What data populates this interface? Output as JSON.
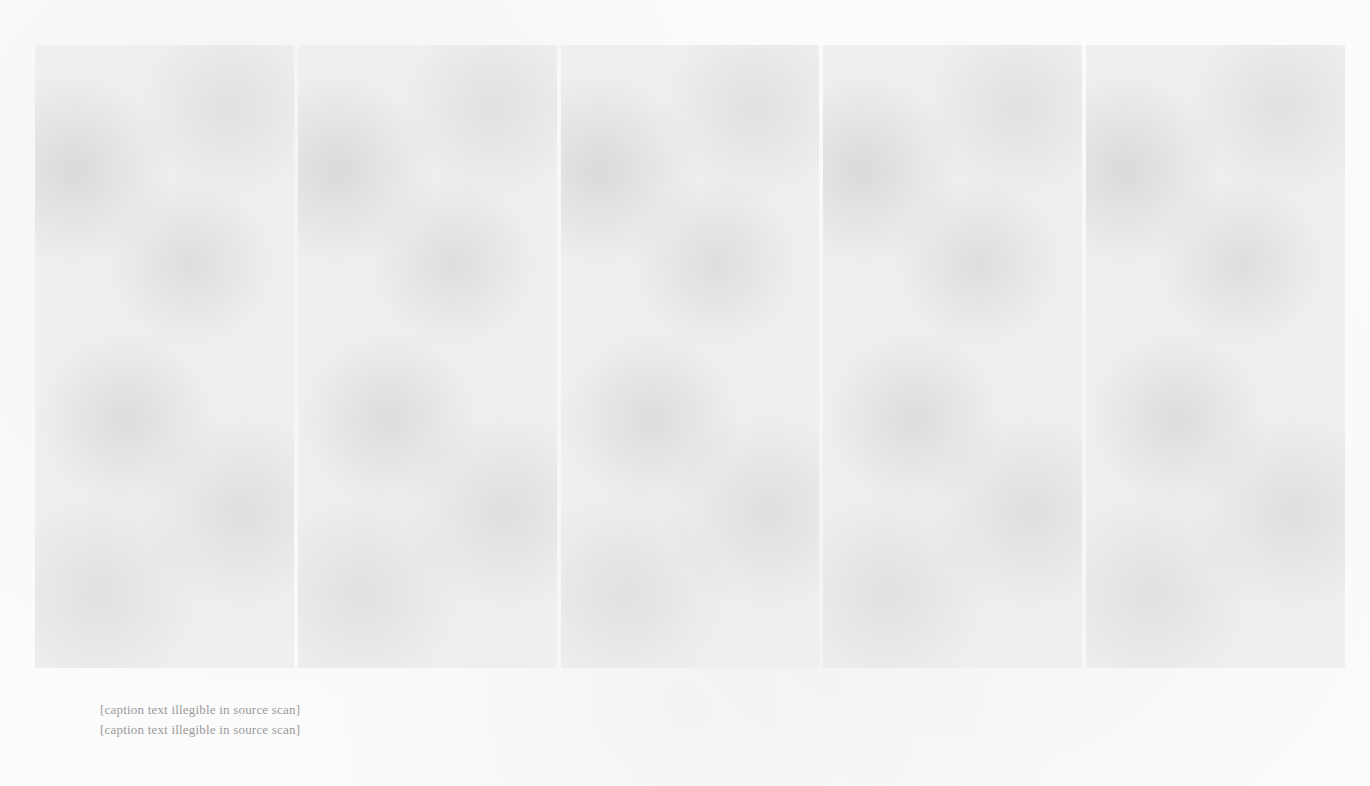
{
  "figure": {
    "panel_count": 5,
    "panels": [
      {
        "label": ""
      },
      {
        "label": ""
      },
      {
        "label": ""
      },
      {
        "label": ""
      },
      {
        "label": ""
      }
    ]
  },
  "caption": {
    "line1": "[caption text illegible in source scan]",
    "line2": "[caption text illegible in source scan]"
  }
}
